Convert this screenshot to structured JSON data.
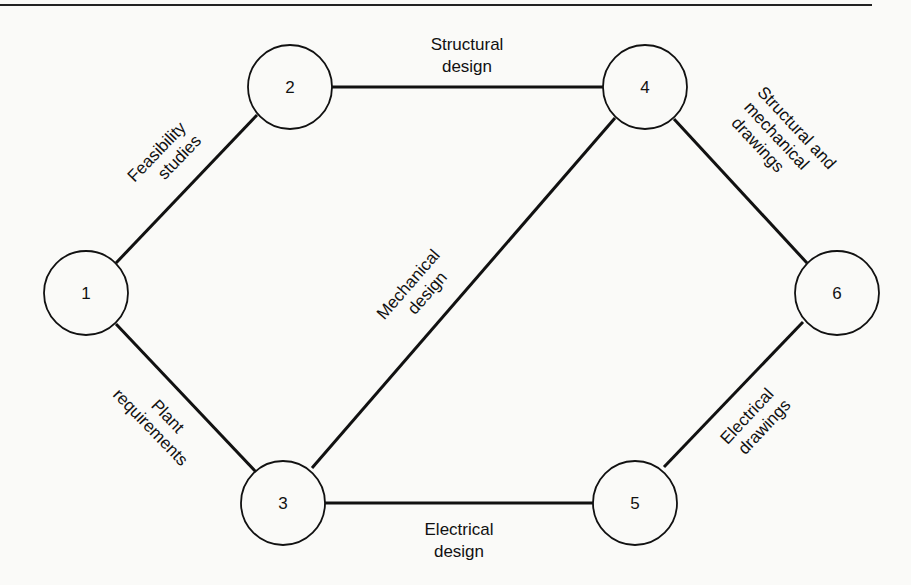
{
  "diagram": {
    "type": "activity-network",
    "nodes": [
      {
        "id": "1",
        "label": "1",
        "cx": 86,
        "cy": 293
      },
      {
        "id": "2",
        "label": "2",
        "cx": 290,
        "cy": 87
      },
      {
        "id": "3",
        "label": "3",
        "cx": 283,
        "cy": 503
      },
      {
        "id": "4",
        "label": "4",
        "cx": 645,
        "cy": 87
      },
      {
        "id": "5",
        "label": "5",
        "cx": 635,
        "cy": 503
      },
      {
        "id": "6",
        "label": "6",
        "cx": 837,
        "cy": 293
      }
    ],
    "edges": [
      {
        "from": "1",
        "to": "2",
        "line1": "Feasibility",
        "line2": "studies"
      },
      {
        "from": "1",
        "to": "3",
        "line1": "Plant",
        "line2": "requirements"
      },
      {
        "from": "2",
        "to": "4",
        "line1": "Structural",
        "line2": "design"
      },
      {
        "from": "3",
        "to": "4",
        "line1": "Mechanical",
        "line2": "design"
      },
      {
        "from": "3",
        "to": "5",
        "line1": "Electrical",
        "line2": "design"
      },
      {
        "from": "4",
        "to": "6",
        "line1": "Structural and",
        "line2": "mechanical",
        "line3": "drawings"
      },
      {
        "from": "5",
        "to": "6",
        "line1": "Electrical",
        "line2": "drawings"
      }
    ]
  },
  "colors": {
    "stroke": "#111111",
    "background": "#fafaf8"
  }
}
